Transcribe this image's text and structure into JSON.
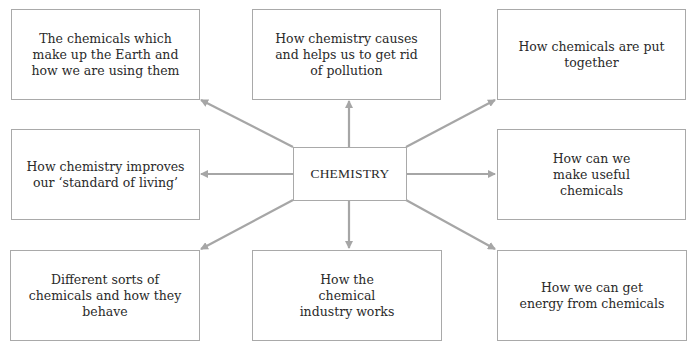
{
  "center": {
    "label": "CHEMISTRY"
  },
  "topics": {
    "top_left": "The chemicals which make up the Earth and how we are using them",
    "top_middle": "How chemistry causes and helps us to get rid of pollution",
    "top_right": "How chemicals are put together",
    "middle_left": "How chemistry improves our ‘standard of living’",
    "middle_right": "How can we make useful chemicals",
    "bottom_left": "Different sorts of chemicals and how they behave",
    "bottom_middle": "How the chemical industry works",
    "bottom_right": "How we can get energy from chemicals"
  },
  "colors": {
    "border": "#a9a9a9",
    "arrow": "#a6a6a6",
    "text": "#2a2a2a"
  }
}
